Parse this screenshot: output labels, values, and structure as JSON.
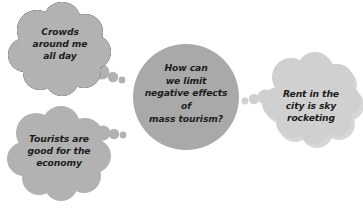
{
  "canvas": {
    "width": 363,
    "height": 211,
    "background": "#ffffff"
  },
  "diagram": {
    "type": "thought-bubble-cluster",
    "central_node": {
      "name": "central-question",
      "shape": "circle",
      "text": "How can\nwe limit\nnegative effects\nof\nmass tourism?",
      "fill": "#a9a9a9"
    },
    "bubbles": [
      {
        "name": "cloud-crowds",
        "shape": "thought-cloud",
        "position": "top-left",
        "text": "Crowds\naround me\nall day",
        "fill": "#b2b2b2"
      },
      {
        "name": "cloud-tourists",
        "shape": "thought-cloud",
        "position": "bottom-left",
        "text": "Tourists are\ngood for the\neconomy",
        "fill": "#b2b2b2"
      },
      {
        "name": "cloud-rent",
        "shape": "thought-cloud",
        "position": "right",
        "text": "Rent in the\ncity is sky\nrocketing",
        "fill": "#d0d0d0"
      }
    ],
    "colors": {
      "text": "#1c1c1c",
      "center_fill": "#a9a9a9",
      "cloud_fill_dark": "#b2b2b2",
      "cloud_fill_light": "#d0d0d0",
      "shadow": "#b8b8b8"
    }
  }
}
